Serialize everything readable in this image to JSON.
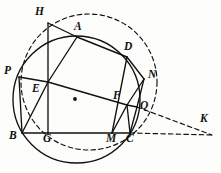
{
  "figure": {
    "kind": "geometry-diagram",
    "canvas": {
      "width": 221,
      "height": 173
    },
    "background_color": "#fdfdfb",
    "stroke_color": "#111111",
    "circle": {
      "name": "solid-circumcircle",
      "cx": 76.5,
      "cy": 99.5,
      "r": 63.5,
      "style": "solid"
    },
    "dashed_circle": {
      "name": "dashed-circle",
      "cx": 89.0,
      "cy": 82.0,
      "r": 68.0,
      "style": "dashed"
    },
    "center_dot": {
      "cx": 75.0,
      "cy": 99.0,
      "r": 1.9
    },
    "points": {
      "H": {
        "x": 48.0,
        "y": 23.0,
        "label": "H",
        "lx": 35.0,
        "ly": 6.0
      },
      "A": {
        "x": 77.0,
        "y": 37.0,
        "label": "A",
        "lx": 74.0,
        "ly": 21.0
      },
      "D": {
        "x": 127.0,
        "y": 57.0,
        "label": "D",
        "lx": 124.0,
        "ly": 41.0
      },
      "N": {
        "x": 144.0,
        "y": 79.0,
        "label": "N",
        "lx": 148.0,
        "ly": 69.0
      },
      "P": {
        "x": 19.0,
        "y": 77.0,
        "label": "P",
        "lx": 4.0,
        "ly": 65.0
      },
      "E": {
        "x": 48.0,
        "y": 82.0,
        "label": "E",
        "lx": 32.0,
        "ly": 83.0
      },
      "F": {
        "x": 127.0,
        "y": 105.0,
        "label": "F",
        "lx": 113.0,
        "ly": 90.0
      },
      "Q": {
        "x": 137.0,
        "y": 107.0,
        "label": "Q",
        "lx": 140.0,
        "ly": 100.0
      },
      "B": {
        "x": 22.0,
        "y": 133.0,
        "label": "B",
        "lx": 9.0,
        "ly": 130.0
      },
      "G": {
        "x": 48.0,
        "y": 133.0,
        "label": "G",
        "lx": 43.0,
        "ly": 133.0
      },
      "M": {
        "x": 112.0,
        "y": 133.0,
        "label": "M",
        "lx": 106.0,
        "ly": 133.0
      },
      "C": {
        "x": 130.0,
        "y": 133.0,
        "label": "C",
        "lx": 126.0,
        "ly": 133.0
      },
      "K": {
        "x": 212.0,
        "y": 135.0,
        "label": "K",
        "lx": 200.0,
        "ly": 113.0
      }
    },
    "solid_segments": [
      {
        "name": "segment-HA",
        "from": "H",
        "to": "A"
      },
      {
        "name": "segment-AD",
        "from": "A",
        "to": "D"
      },
      {
        "name": "segment-HG",
        "from": "H",
        "to": "G"
      },
      {
        "name": "segment-AE",
        "from": "A",
        "to": "E"
      },
      {
        "name": "segment-EB",
        "from": "E",
        "to": "B"
      },
      {
        "name": "segment-PE",
        "from": "P",
        "to": "E"
      },
      {
        "name": "segment-EF",
        "from": "E",
        "to": "F"
      },
      {
        "name": "segment-FQ",
        "from": "F",
        "to": "Q"
      },
      {
        "name": "segment-PB",
        "from": "P",
        "to": "B"
      },
      {
        "name": "segment-BG",
        "from": "B",
        "to": "G"
      },
      {
        "name": "segment-GM",
        "from": "G",
        "to": "M"
      },
      {
        "name": "segment-MC",
        "from": "M",
        "to": "C"
      },
      {
        "name": "segment-DM",
        "from": "D",
        "to": "M"
      },
      {
        "name": "segment-DN",
        "from": "D",
        "to": "N"
      },
      {
        "name": "segment-NQ",
        "from": "N",
        "to": "Q"
      },
      {
        "name": "segment-NF",
        "from": "N",
        "to": "F"
      },
      {
        "name": "segment-FM",
        "from": "F",
        "to": "M"
      },
      {
        "name": "segment-FC",
        "from": "F",
        "to": "C"
      },
      {
        "name": "segment-QC",
        "from": "Q",
        "to": "C"
      }
    ],
    "dashed_segments": [
      {
        "name": "segment-QK",
        "from": "Q",
        "to": "K"
      },
      {
        "name": "segment-CK",
        "from": "C",
        "to": "K"
      }
    ]
  }
}
